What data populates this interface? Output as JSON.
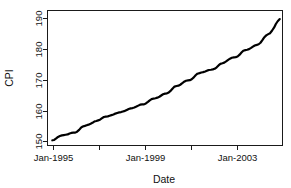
{
  "chart_data": {
    "type": "line",
    "title": "",
    "xlabel": "Date",
    "ylabel": "CPI",
    "grid": false,
    "legend": false,
    "legend_position": "none",
    "xlim": [
      1994.75,
      2005.0
    ],
    "ylim": [
      148.6,
      192.6
    ],
    "y_ticks": [
      150,
      160,
      170,
      180,
      190
    ],
    "y_tick_labels": [
      "150",
      "160",
      "170",
      "180",
      "190"
    ],
    "x_ticks": [
      1995,
      1997,
      1999,
      2001,
      2003
    ],
    "x_tick_labels": [
      "Jan-1995",
      "",
      "Jan-1999",
      "",
      "Jan-2003"
    ],
    "x_labeled_ticks": [
      {
        "value": 1995,
        "label": "Jan-1995"
      },
      {
        "value": 1999,
        "label": "Jan-1999"
      },
      {
        "value": 2003,
        "label": "Jan-2003"
      }
    ],
    "series": [
      {
        "name": "CPI",
        "color": "#000000",
        "x": [
          1994.96,
          1995.04,
          1995.13,
          1995.21,
          1995.29,
          1995.38,
          1995.46,
          1995.54,
          1995.63,
          1995.71,
          1995.79,
          1995.88,
          1995.96,
          1996.04,
          1996.13,
          1996.21,
          1996.29,
          1996.38,
          1996.46,
          1996.54,
          1996.63,
          1996.71,
          1996.79,
          1996.88,
          1996.96,
          1997.04,
          1997.13,
          1997.21,
          1997.29,
          1997.38,
          1997.46,
          1997.54,
          1997.63,
          1997.71,
          1997.79,
          1997.88,
          1997.96,
          1998.04,
          1998.13,
          1998.21,
          1998.29,
          1998.38,
          1998.46,
          1998.54,
          1998.63,
          1998.71,
          1998.79,
          1998.88,
          1998.96,
          1999.04,
          1999.13,
          1999.21,
          1999.29,
          1999.38,
          1999.46,
          1999.54,
          1999.63,
          1999.71,
          1999.79,
          1999.88,
          1999.96,
          2000.04,
          2000.13,
          2000.21,
          2000.29,
          2000.38,
          2000.46,
          2000.54,
          2000.63,
          2000.71,
          2000.79,
          2000.88,
          2000.96,
          2001.04,
          2001.13,
          2001.21,
          2001.29,
          2001.38,
          2001.46,
          2001.54,
          2001.63,
          2001.71,
          2001.79,
          2001.88,
          2001.96,
          2002.04,
          2002.13,
          2002.21,
          2002.29,
          2002.38,
          2002.46,
          2002.54,
          2002.63,
          2002.71,
          2002.79,
          2002.88,
          2002.96,
          2003.04,
          2003.13,
          2003.21,
          2003.29,
          2003.38,
          2003.46,
          2003.54,
          2003.63,
          2003.71,
          2003.79,
          2003.88,
          2003.96,
          2004.04,
          2004.13,
          2004.21,
          2004.29,
          2004.38,
          2004.46,
          2004.54,
          2004.63,
          2004.71,
          2004.79,
          2004.88
        ],
        "values": [
          150.3,
          150.4,
          150.9,
          151.4,
          151.7,
          151.9,
          152.0,
          152.1,
          152.2,
          152.5,
          152.7,
          152.8,
          152.8,
          153.1,
          153.7,
          154.4,
          154.8,
          155.0,
          155.2,
          155.4,
          155.7,
          156.0,
          156.4,
          156.6,
          156.8,
          157.0,
          157.5,
          157.9,
          158.0,
          158.1,
          158.3,
          158.5,
          158.7,
          159.0,
          159.2,
          159.4,
          159.5,
          159.7,
          159.9,
          160.2,
          160.5,
          160.7,
          160.8,
          161.0,
          161.3,
          161.6,
          161.9,
          162.0,
          162.0,
          162.3,
          162.8,
          163.3,
          163.7,
          163.9,
          164.0,
          164.2,
          164.5,
          164.9,
          165.3,
          165.5,
          165.6,
          165.9,
          166.5,
          167.2,
          167.8,
          168.0,
          168.1,
          168.4,
          168.9,
          169.4,
          169.7,
          169.8,
          169.9,
          170.2,
          170.8,
          171.5,
          172.0,
          172.2,
          172.4,
          172.5,
          172.7,
          173.0,
          173.2,
          173.3,
          173.4,
          173.6,
          174.1,
          174.7,
          175.2,
          175.4,
          175.6,
          176.0,
          176.5,
          176.9,
          177.2,
          177.3,
          177.4,
          177.6,
          178.2,
          178.9,
          179.5,
          179.7,
          179.8,
          180.0,
          180.4,
          180.8,
          181.2,
          181.4,
          181.6,
          182.1,
          183.0,
          183.9,
          184.5,
          184.9,
          185.2,
          186.0,
          187.0,
          188.2,
          189.1,
          189.8
        ]
      }
    ],
    "annotations": []
  },
  "accessibility": {
    "chart_description": "Line chart of CPI versus Date, rising steadily from about 150 in Jan-1995 to about 191 near 2005."
  },
  "colors": {
    "line": "#000000",
    "axis": "#1a1a1a",
    "background": "#ffffff"
  }
}
